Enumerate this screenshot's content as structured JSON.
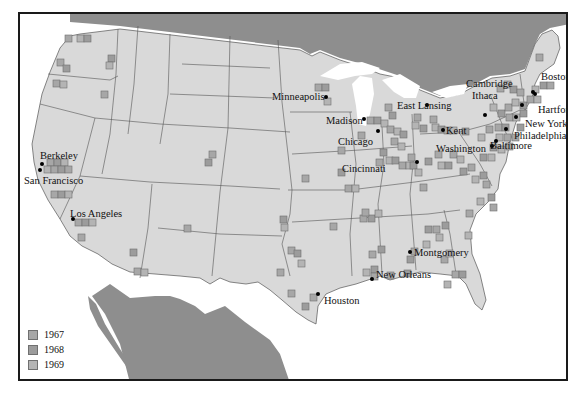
{
  "map": {
    "colors": {
      "us_land": "#d9d9d9",
      "foreign_land": "#8e8e8e",
      "water": "#ffffff",
      "state_border": "#555555",
      "marker_1967": "#a7a7a7",
      "marker_1968": "#9c9c9c",
      "marker_1969": "#b4b4b4",
      "frame": "#1a1a1a"
    },
    "cities": [
      {
        "name": "Berkeley",
        "x": 20,
        "y": 148
      },
      {
        "name": "San Francisco",
        "x": 4,
        "y": 175
      },
      {
        "name": "Los Angeles",
        "x": 50,
        "y": 200
      },
      {
        "name": "Minneapolis",
        "x": 252,
        "y": 86
      },
      {
        "name": "Madison",
        "x": 306,
        "y": 109
      },
      {
        "name": "Chicago",
        "x": 318,
        "y": 126
      },
      {
        "name": "East Lansing",
        "x": 378,
        "y": 96
      },
      {
        "name": "Kent",
        "x": 425,
        "y": 119
      },
      {
        "name": "Cincinnati",
        "x": 323,
        "y": 154
      },
      {
        "name": "Washington",
        "x": 418,
        "y": 138
      },
      {
        "name": "Baltimore",
        "x": 472,
        "y": 138
      },
      {
        "name": "Ithaca",
        "x": 452,
        "y": 83
      },
      {
        "name": "Cambridge",
        "x": 446,
        "y": 71
      },
      {
        "name": "Boston",
        "x": 521,
        "y": 64
      },
      {
        "name": "Hartford",
        "x": 518,
        "y": 99
      },
      {
        "name": "New York",
        "x": 505,
        "y": 115
      },
      {
        "name": "Philadelphia",
        "x": 494,
        "y": 127
      },
      {
        "name": "Houston",
        "x": 305,
        "y": 273
      },
      {
        "name": "New Orleans",
        "x": 359,
        "y": 258
      },
      {
        "name": "Montgomery",
        "x": 393,
        "y": 236
      }
    ],
    "legend": [
      {
        "label": "1967",
        "color": "#a7a7a7"
      },
      {
        "label": "1968",
        "color": "#9c9c9c"
      },
      {
        "label": "1969",
        "color": "#b4b4b4"
      }
    ]
  }
}
